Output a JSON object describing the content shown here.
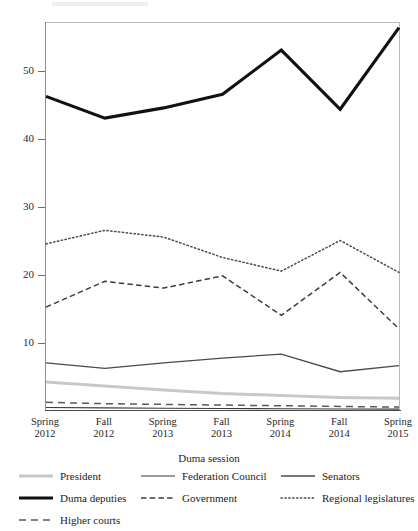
{
  "chart_data": {
    "type": "line",
    "title": "",
    "xlabel": "Duma session",
    "ylabel": "",
    "categories": [
      "Spring 2012",
      "Fall 2012",
      "Spring 2013",
      "Fall 2013",
      "Spring 2014",
      "Fall 2014",
      "Spring 2015"
    ],
    "category_lines": [
      [
        "Spring",
        "2012"
      ],
      [
        "Fall",
        "2012"
      ],
      [
        "Spring",
        "2013"
      ],
      [
        "Fall",
        "2013"
      ],
      [
        "Spring",
        "2014"
      ],
      [
        "Fall",
        "2014"
      ],
      [
        "Spring",
        "2015"
      ]
    ],
    "ylim": [
      0,
      58
    ],
    "yticks": [
      10,
      20,
      30,
      40,
      50
    ],
    "ytick_labels": [
      "10",
      "20",
      "30",
      "40",
      "50"
    ],
    "grid": false,
    "legend_position": "bottom",
    "series": [
      {
        "name": "President",
        "style": "solid",
        "color": "#c8c8c8",
        "width": 3.0,
        "values": [
          4.2,
          3.6,
          3.0,
          2.5,
          2.2,
          1.9,
          1.8
        ]
      },
      {
        "name": "Federation Council",
        "style": "solid",
        "color": "#3a3a3a",
        "width": 1.1,
        "values": [
          0.45,
          0.38,
          0.32,
          0.3,
          0.26,
          0.22,
          0.2
        ]
      },
      {
        "name": "Senators",
        "style": "solid",
        "color": "#4a4a4a",
        "width": 1.3,
        "values": [
          7.0,
          6.2,
          7.0,
          7.7,
          8.3,
          5.7,
          6.6
        ]
      },
      {
        "name": "Duma deputies",
        "style": "solid",
        "color": "#111111",
        "width": 3.1,
        "values": [
          46.2,
          43.0,
          44.5,
          46.5,
          53.0,
          44.3,
          56.3
        ]
      },
      {
        "name": "Government",
        "style": "dashed",
        "color": "#3c3c3c",
        "width": 1.5,
        "values": [
          15.2,
          19.0,
          18.0,
          19.8,
          14.0,
          20.3,
          12.0
        ]
      },
      {
        "name": "Regional legislatures",
        "style": "dotted",
        "color": "#4a4a4a",
        "width": 1.5,
        "values": [
          24.5,
          26.5,
          25.5,
          22.5,
          20.5,
          25.0,
          20.3
        ]
      },
      {
        "name": "Higher courts",
        "style": "longdashed",
        "color": "#5a5a5a",
        "width": 1.5,
        "values": [
          1.2,
          1.0,
          0.9,
          0.8,
          0.7,
          0.6,
          0.5
        ]
      }
    ]
  },
  "legend": {
    "entries": [
      {
        "label": "President",
        "series": 0,
        "col": 0,
        "row": 0
      },
      {
        "label": "Federation Council",
        "series": 1,
        "col": 1,
        "row": 0
      },
      {
        "label": "Senators",
        "series": 2,
        "col": 2,
        "row": 0
      },
      {
        "label": "Duma deputies",
        "series": 3,
        "col": 0,
        "row": 1
      },
      {
        "label": "Government",
        "series": 4,
        "col": 1,
        "row": 1
      },
      {
        "label": "Regional legislatures",
        "series": 5,
        "col": 2,
        "row": 1
      },
      {
        "label": "Higher courts",
        "series": 6,
        "col": 0,
        "row": 2
      }
    ]
  }
}
